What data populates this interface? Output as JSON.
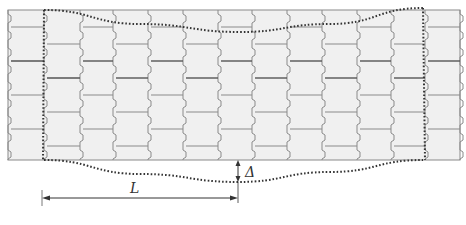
{
  "figure": {
    "type": "schematic",
    "labels": {
      "span": "L",
      "deflection": "Δ"
    },
    "wall": {
      "x0": 8,
      "x1": 460,
      "y0": 10,
      "y1": 160,
      "column_joints_x": [
        8,
        44,
        80,
        113,
        148,
        183,
        218,
        252,
        287,
        322,
        357,
        391,
        425,
        460
      ],
      "course_height": 17,
      "stagger_offset": 17,
      "strong_joint_rows_even": [
        61,
        112
      ],
      "strong_joint_rows_odd": [
        78,
        129
      ]
    },
    "deformed_outline": {
      "top": [
        [
          44,
          10
        ],
        [
          140,
          24
        ],
        [
          240,
          32
        ],
        [
          330,
          24
        ],
        [
          423,
          8
        ]
      ],
      "bottom": [
        [
          44,
          160
        ],
        [
          140,
          174
        ],
        [
          238,
          182
        ],
        [
          330,
          172
        ],
        [
          423,
          160
        ]
      ],
      "left_x": 44,
      "right_x": 425
    },
    "dimension_L": {
      "x0": 42,
      "x1": 238,
      "y": 198
    },
    "dimension_delta": {
      "x": 238,
      "y0": 160,
      "y1": 182
    },
    "colors": {
      "block_fill": "#f0f0f0",
      "joint_line": "#8a8a8a",
      "strong_line": "#555555",
      "dotted": "#333333",
      "arrow": "#333333"
    }
  }
}
